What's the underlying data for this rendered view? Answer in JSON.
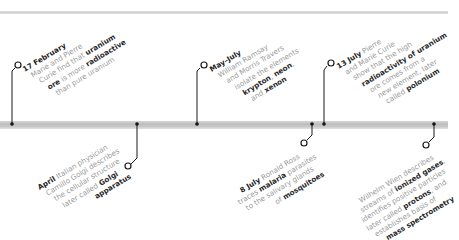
{
  "timeline": {
    "colors": {
      "axis": "#c4c4c4",
      "connector": "#1a1a1a",
      "text_body": "#9a9a9a",
      "text_bold": "#2a2a2a"
    },
    "events_above": [
      {
        "date": "17 February",
        "lines": [
          {
            "pre": "Marie and Pierre",
            "bold": "",
            "post": ""
          },
          {
            "pre": "Curie find that ",
            "bold": "uranium",
            "post": ""
          },
          {
            "pre": "",
            "bold": "ore",
            "post": " is more "
          },
          {
            "pre": "",
            "bold": "radioactive",
            "post": ""
          },
          {
            "pre": "than pure uranium",
            "bold": "",
            "post": ""
          }
        ],
        "text": "Marie and Pierre Curie find that uranium ore is more radioactive than pure uranium"
      },
      {
        "date": "May–July",
        "lines": [
          {
            "pre": "William Ramsay",
            "bold": "",
            "post": ""
          },
          {
            "pre": "and Morris Travers",
            "bold": "",
            "post": ""
          },
          {
            "pre": "isolate the elements",
            "bold": "",
            "post": ""
          },
          {
            "pre": "",
            "bold": "krypton",
            "post": ", "
          },
          {
            "pre": "",
            "bold": "neon",
            "post": ","
          },
          {
            "pre": "and ",
            "bold": "xenon",
            "post": ""
          }
        ],
        "text": "William Ramsay and Morris Travers isolate the elements krypton, neon, and xenon"
      },
      {
        "date": "13 July",
        "lines": [
          {
            "pre": " Pierre",
            "bold": "",
            "post": ""
          },
          {
            "pre": "and Marie Curie",
            "bold": "",
            "post": ""
          },
          {
            "pre": "show that the high",
            "bold": "",
            "post": ""
          },
          {
            "pre": "",
            "bold": "radioactivity of uranium",
            "post": ""
          },
          {
            "pre": "ore comes from a",
            "bold": "",
            "post": ""
          },
          {
            "pre": "new element, later",
            "bold": "",
            "post": ""
          },
          {
            "pre": "called ",
            "bold": "polonium",
            "post": ""
          }
        ],
        "text": "Pierre and Marie Curie show that the high radioactivity of uranium ore comes from a new element, later called polonium"
      }
    ],
    "events_below": [
      {
        "date": "April",
        "lines": [
          {
            "pre": " Italian physician",
            "bold": "",
            "post": ""
          },
          {
            "pre": "Camillo Golgi describes",
            "bold": "",
            "post": ""
          },
          {
            "pre": "the cellular structure",
            "bold": "",
            "post": ""
          },
          {
            "pre": "later called ",
            "bold": "Golgi",
            "post": ""
          },
          {
            "pre": "",
            "bold": "apparatus",
            "post": ""
          }
        ],
        "text": "Italian physician Camillo Golgi describes the cellular structure later called Golgi apparatus"
      },
      {
        "date": "8 July",
        "lines": [
          {
            "pre": " Ronald Ross",
            "bold": "",
            "post": ""
          },
          {
            "pre": "traces ",
            "bold": "malaria",
            "post": " parasites"
          },
          {
            "pre": "to the salivary glands",
            "bold": "",
            "post": ""
          },
          {
            "pre": "of ",
            "bold": "mosquitoes",
            "post": ""
          }
        ],
        "text": "Ronald Ross traces malaria parasites to the salivary glands of mosquitoes"
      },
      {
        "date": "",
        "lines": [
          {
            "pre": "Wilhelm Wien describes",
            "bold": "",
            "post": ""
          },
          {
            "pre": "streams of ",
            "bold": "ionized gases",
            "post": ","
          },
          {
            "pre": "identifies positive particles",
            "bold": "",
            "post": ""
          },
          {
            "pre": "later called ",
            "bold": "protons",
            "post": ", and"
          },
          {
            "pre": "establishes basis of",
            "bold": "",
            "post": ""
          },
          {
            "pre": "",
            "bold": "mass spectrometry",
            "post": ""
          }
        ],
        "text": "Wilhelm Wien describes streams of ionized gases, identifies positive particles later called protons, and establishes basis of mass spectrometry"
      }
    ]
  }
}
